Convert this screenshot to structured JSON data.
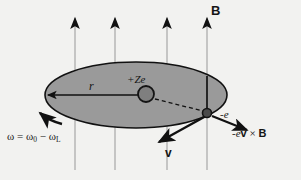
{
  "figure": {
    "background_color": "#f2f2f0",
    "orbit_fill_color": "#9a9a9a",
    "outline_color": "#111111",
    "field_line_color": "#b9b9b9"
  },
  "labels": {
    "magnetic_field": "B",
    "nucleus_charge": "+Ze",
    "radius": "r",
    "electron_charge": "-e",
    "velocity": "v",
    "lorentz_force_prefix": "-e",
    "lorentz_force_v": "v",
    "lorentz_force_times": " × ",
    "lorentz_force_B": "B",
    "angular_frequency_lhs": "ω = ω",
    "angular_frequency_sub0": "0",
    "angular_frequency_minus": " − ω",
    "angular_frequency_subL": "L"
  },
  "elements": {
    "field_lines": [
      {
        "name": "field-line-1",
        "x": 75,
        "y_top": 14,
        "y_bottom": 170
      },
      {
        "name": "field-line-2",
        "x": 115,
        "y_top": 14,
        "y_bottom": 170
      },
      {
        "name": "field-line-3",
        "x": 167,
        "y_top": 14,
        "y_bottom": 170
      },
      {
        "name": "field-line-4",
        "x": 207,
        "y_top": 14,
        "y_bottom": 170
      }
    ],
    "orbit_ellipse": {
      "cx": 136,
      "cy": 95,
      "rx": 91,
      "ry": 33
    },
    "nucleus": {
      "cx": 146,
      "cy": 94,
      "r": 8,
      "fill": "#7f7f7f"
    },
    "electron": {
      "cx": 207,
      "cy": 113,
      "r": 4.5,
      "fill": "#4a4a4a"
    },
    "radius_arrow": {
      "x1": 146,
      "y1": 95,
      "x2": 47,
      "y2": 95
    },
    "dashed_nucleus_to_electron": {
      "x1": 154,
      "y1": 99,
      "x2": 203,
      "y2": 111
    },
    "velocity_arrow": {
      "x1": 206,
      "y1": 116,
      "x2": 158,
      "y2": 142
    },
    "force_arrow": {
      "x1": 212,
      "y1": 116,
      "x2": 248,
      "y2": 131
    },
    "orbit_direction_arrow": {
      "x": 38,
      "y": 122
    }
  }
}
